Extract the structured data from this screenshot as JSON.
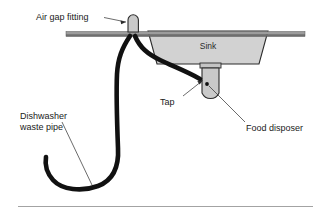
{
  "diagram": {
    "title": "Air gap fitting sink and dishwasher waste pipe diagram",
    "background_color": "#ffffff",
    "labels": {
      "air_gap_fitting": "Air gap fitting",
      "sink": "Sink",
      "tap": "Tap",
      "food_disposer": "Food disposer",
      "dishwasher_waste_pipe_line1": "Dishwasher",
      "dishwasher_waste_pipe_line2": "waste pipe"
    },
    "colors": {
      "pipe": "#111111",
      "outline": "#2b2b2b",
      "fill_light": "#d4d4d4",
      "fill_mid": "#c9c9c9",
      "counter_top": "#9a9a9a",
      "counter_bottom": "#6e6e6e",
      "text": "#1a1a1a",
      "rule": "#8c8c8c"
    }
  }
}
